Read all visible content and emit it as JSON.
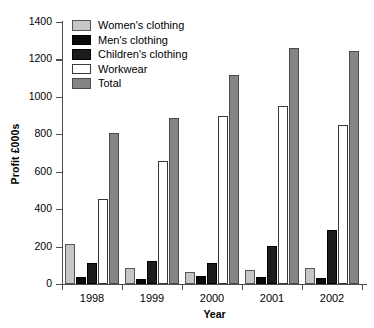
{
  "chart_data": {
    "type": "bar",
    "title": "",
    "xlabel": "Year",
    "ylabel": "Profit £000s",
    "categories": [
      "1998",
      "1999",
      "2000",
      "2001",
      "2002"
    ],
    "ylim": [
      0,
      1400
    ],
    "ytick_step": 200,
    "yticks": [
      0,
      200,
      400,
      600,
      800,
      1000,
      1200,
      1400
    ],
    "ytick_labels": [
      "0",
      "200",
      "400",
      "600",
      "800",
      "1000",
      "1200",
      "1400"
    ],
    "grid": false,
    "legend_position": "top-left-inside",
    "series": [
      {
        "name": "Women's clothing",
        "color": "#c6c6c6",
        "swatch": "light-gray",
        "values": [
          215,
          85,
          65,
          75,
          85
        ]
      },
      {
        "name": "Men's clothing",
        "color": "#0a0a0a",
        "swatch": "black",
        "values": [
          35,
          25,
          45,
          40,
          30
        ]
      },
      {
        "name": "Children's clothing",
        "color": "#1c1c1c",
        "swatch": "dark-gray",
        "values": [
          110,
          125,
          110,
          205,
          290
        ]
      },
      {
        "name": "Workwear",
        "color": "#ffffff",
        "swatch": "white",
        "values": [
          455,
          655,
          900,
          950,
          850
        ]
      },
      {
        "name": "Total",
        "color": "#858585",
        "swatch": "medium-gray",
        "values": [
          805,
          885,
          1115,
          1260,
          1245
        ]
      }
    ]
  },
  "legend": {
    "items": [
      {
        "label": "Women's clothing"
      },
      {
        "label": "Men's clothing"
      },
      {
        "label": "Children's clothing"
      },
      {
        "label": "Workwear"
      },
      {
        "label": "Total"
      }
    ]
  },
  "axes": {
    "y_title": "Profit £000s",
    "x_title": "Year"
  }
}
